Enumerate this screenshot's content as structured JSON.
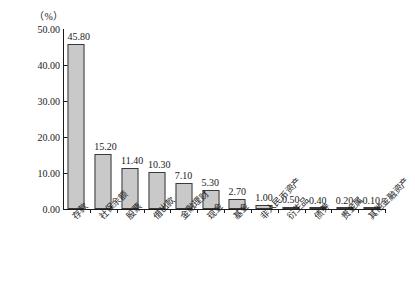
{
  "chart_data": {
    "type": "bar",
    "title": "",
    "subtitle": "",
    "xlabel": "",
    "ylabel": "",
    "unit_label": "（%）",
    "ylim": [
      0,
      50
    ],
    "yticks": [
      "0.00",
      "10.00",
      "20.00",
      "30.00",
      "40.00",
      "50.00"
    ],
    "ytick_values": [
      0,
      10,
      20,
      30,
      40,
      50
    ],
    "grid": false,
    "legend": false,
    "legend_position": "none",
    "bar_fill_color": "#c9c9c9",
    "bar_border_color": "#3a3a3a",
    "axis_color": "#1a1a1a",
    "categories": [
      "存款",
      "社保余额",
      "股票",
      "借出款",
      "金融理财",
      "现金",
      "基金",
      "非人民币资产",
      "衍生品",
      "债券",
      "贵金属",
      "其他金融资产"
    ],
    "values": [
      45.8,
      15.2,
      11.4,
      10.3,
      7.1,
      5.3,
      2.7,
      1.0,
      0.5,
      0.4,
      0.2,
      0.1
    ],
    "value_labels": [
      "45.80",
      "15.20",
      "11.40",
      "10.30",
      "7.10",
      "5.30",
      "2.70",
      "1.00",
      "0.50",
      "0.40",
      "0.20",
      "0.10"
    ]
  }
}
